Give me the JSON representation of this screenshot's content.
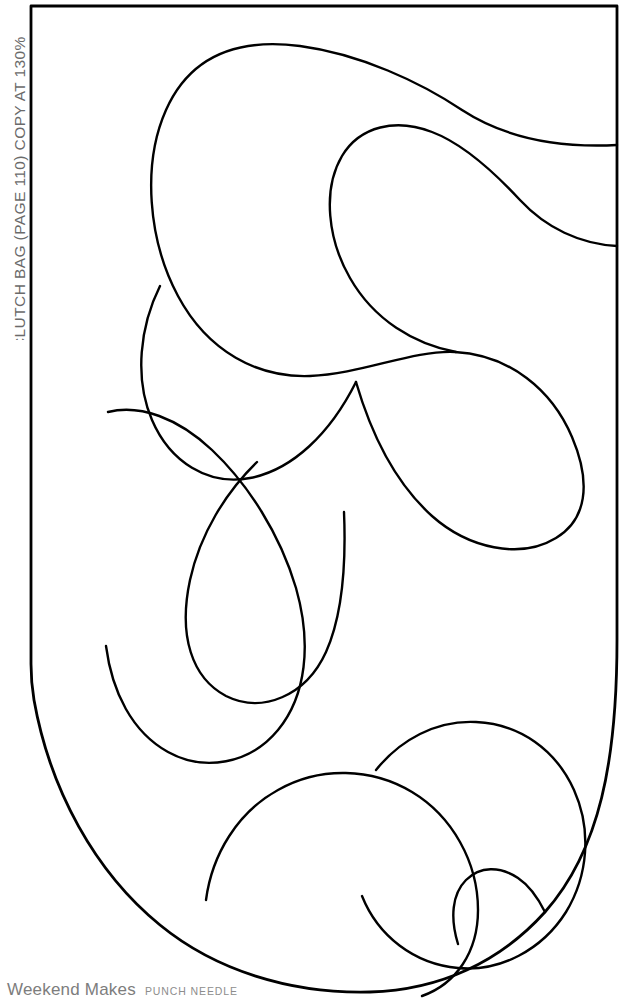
{
  "page": {
    "title_caption": "CLUTCH BAG (PAGE 110) COPY AT 130%",
    "background_color": "#ffffff",
    "width": 624,
    "height": 1007
  },
  "side_caption": {
    "text": "CLUTCH BAG (PAGE 110) COPY AT 130%",
    "color": "#6a6a6a",
    "orientation": "rotated-90-ccw"
  },
  "footer": {
    "brand": "Weekend Makes",
    "series": "PUNCH NEEDLE",
    "brand_color": "#7d7d7d",
    "series_color": "#8d8d8d"
  },
  "artwork": {
    "name": "clutch-bag-punch-needle-template",
    "stroke_color": "#000000",
    "fill_color": "none",
    "stroke_width": 2.4,
    "template_outline": {
      "name": "clutch-bag-template-outline",
      "description": "Rectangular panel with straight top and sides and a rounded U-shaped bottom",
      "path": "M 31 6 L 617 6 L 617 640 C 617 760 600 850 545 912 C 500 962 440 990 370 992 C 290 994 215 970 160 925 C 95 872 50 790 34 700 C 32 688 31 676 31 664 Z"
    },
    "curves": [
      {
        "name": "upper-large-swirl",
        "path": "M 617 145 C 560 148 505 138 462 110 C 420 82 360 54 300 46 C 238 38 190 56 166 110 C 142 164 148 240 178 296 C 208 352 258 378 310 376 C 362 374 412 350 455 352 C 510 355 552 390 572 437 C 592 484 586 520 556 538 C 520 560 468 548 432 516 C 392 480 370 430 356 382"
      },
      {
        "name": "upper-inner-hook",
        "path": "M 617 246 C 580 244 546 228 520 200 C 494 172 464 144 432 132 C 396 118 360 126 342 156 C 322 190 328 240 350 278 C 374 320 414 344 456 352"
      },
      {
        "name": "middle-left-loop",
        "path": "M 356 382 C 330 434 292 470 250 478 C 208 486 170 462 152 420 C 134 378 140 326 160 286"
      },
      {
        "name": "middle-teardrop",
        "path": "M 257 462 C 226 492 200 534 190 580 C 178 636 192 678 226 696 C 262 714 306 696 326 652 C 344 612 346 560 344 512"
      },
      {
        "name": "lower-left-sweep",
        "path": "M 108 412 C 140 404 178 418 212 450 C 248 484 280 534 296 588 C 312 644 306 696 278 730 C 250 764 204 772 168 752 C 132 732 112 692 106 646"
      },
      {
        "name": "lower-right-blob",
        "path": "M 376 770 C 400 740 436 720 476 722 C 520 724 556 750 574 790 C 592 830 588 876 566 912 C 542 950 500 972 458 968 C 414 964 378 936 362 896"
      },
      {
        "name": "bottom-big-blob",
        "path": "M 206 900 C 212 854 238 812 278 790 C 320 766 372 768 412 792 C 452 816 478 862 478 910 C 478 952 456 984 422 996"
      },
      {
        "name": "bottom-right-tail",
        "path": "M 545 912 C 538 898 530 886 518 878 C 500 866 480 866 466 880 C 452 894 450 918 458 944"
      }
    ]
  }
}
